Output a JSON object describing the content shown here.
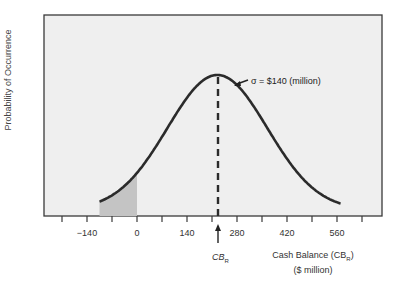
{
  "chart_data": {
    "type": "line",
    "title": "",
    "xlabel": "Cash Balance (CB_R) ($ million)",
    "xlabel_line1": "Cash Balance (CB",
    "xlabel_sub": "R",
    "xlabel_line1_end": ")",
    "xlabel_line2": "($ million)",
    "ylabel": "Probability of Occurrence",
    "x_ticks": [
      -140,
      0,
      140,
      280,
      420,
      560
    ],
    "x_tick_labels": [
      "−140",
      "0",
      "140",
      "280",
      "420",
      "560"
    ],
    "xlim": [
      -210,
      630
    ],
    "distribution": "normal",
    "mean": 225,
    "std_dev": 140,
    "curve_x_range": [
      -105,
      570
    ],
    "shaded_region": {
      "from": -105,
      "to": 0,
      "meaning": "probability of negative cash balance"
    },
    "mean_marker": {
      "label_main": "CB",
      "label_sub": "R",
      "style": "dashed vertical line with arrow"
    },
    "annotation": "σ = $140 (million)",
    "grid": false,
    "legend": "none"
  },
  "colors": {
    "plot_bg": "#efefef",
    "curve": "#2b2b2b",
    "shade": "#c4c4c4",
    "frame": "#3a3a3a"
  }
}
